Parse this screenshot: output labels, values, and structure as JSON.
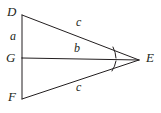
{
  "figure": {
    "type": "geometry-diagram",
    "background_color": "#ffffff",
    "stroke_color": "#231f20",
    "stroke_width": 1,
    "vertices": [
      {
        "name": "D",
        "x": 22,
        "y": 15
      },
      {
        "name": "G",
        "x": 22,
        "y": 58
      },
      {
        "name": "F",
        "x": 22,
        "y": 99
      },
      {
        "name": "E",
        "x": 139,
        "y": 60
      }
    ],
    "vertex_labels": [
      {
        "id": "D",
        "text": "D"
      },
      {
        "id": "G",
        "text": "G"
      },
      {
        "id": "F",
        "text": "F"
      },
      {
        "id": "E",
        "text": "E"
      }
    ],
    "segments": [
      {
        "id": "DG",
        "from": "D",
        "to": "G",
        "label": "a"
      },
      {
        "id": "GF",
        "from": "G",
        "to": "F",
        "label": "a"
      },
      {
        "id": "DE",
        "from": "D",
        "to": "E",
        "label": "c"
      },
      {
        "id": "FE",
        "from": "F",
        "to": "E",
        "label": "c"
      },
      {
        "id": "GE",
        "from": "G",
        "to": "E",
        "label": "b"
      }
    ],
    "side_labels": [
      {
        "id": "a",
        "text": "a",
        "segment": "DG"
      },
      {
        "id": "c-upper",
        "text": "c",
        "segment": "DE"
      },
      {
        "id": "b",
        "text": "b",
        "segment": "GE"
      },
      {
        "id": "c-lower",
        "text": "c",
        "segment": "FE"
      }
    ],
    "angle_marks": [
      {
        "id": "angle-DEG",
        "at_vertex": "E",
        "between": [
          "ED",
          "EG"
        ],
        "ticks": 1
      },
      {
        "id": "angle-GEF",
        "at_vertex": "E",
        "between": [
          "EG",
          "EF"
        ],
        "ticks": 1
      }
    ]
  }
}
